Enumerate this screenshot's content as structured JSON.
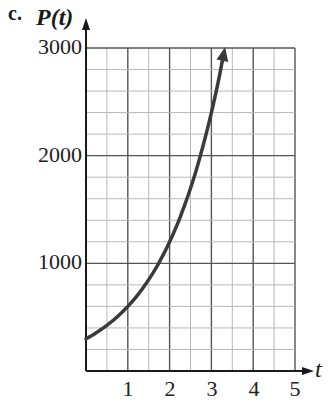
{
  "chart_data": {
    "type": "line",
    "part_label": "c.",
    "title": "",
    "xlabel": "t",
    "ylabel": "P(t)",
    "xlim": [
      0,
      5
    ],
    "ylim": [
      0,
      3000
    ],
    "x_ticks": [
      1,
      2,
      3,
      4,
      5
    ],
    "x_tick_labels": [
      "1",
      "2",
      "3",
      "4",
      "5"
    ],
    "y_ticks": [
      1000,
      2000,
      3000
    ],
    "y_tick_labels": [
      "1000",
      "2000",
      "3000"
    ],
    "grid": true,
    "grid_minor_x_step": 0.5,
    "grid_minor_y_step": 200,
    "legend": null,
    "series": [
      {
        "name": "P(t)",
        "formula_estimate": "P(t) = 300 * 2^t",
        "x": [
          0,
          0.5,
          1,
          1.5,
          2,
          2.5,
          3,
          3.3
        ],
        "y": [
          300,
          424,
          600,
          849,
          1200,
          1697,
          2400,
          2955
        ],
        "arrow_at_end": true
      }
    ]
  },
  "colors": {
    "curve": "#3a3a3a",
    "axis": "#1a1a1a",
    "major_grid": "#555555",
    "minor_grid": "#b8b8b8"
  }
}
